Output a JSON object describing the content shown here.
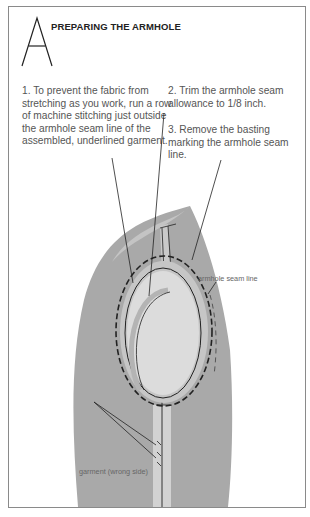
{
  "header": {
    "initial_letter": "A",
    "title": "PREPARING THE ARMHOLE"
  },
  "steps": [
    {
      "text": "1. To prevent the fabric from stretching as you work, run a row of machine stitching just outside the armhole seam line of the assembled, underlined garment."
    },
    {
      "text": "2. Trim the armhole seam allowance to 1/8 inch."
    },
    {
      "text": "3. Remove the basting marking the armhole seam line."
    }
  ],
  "labels": {
    "armhole_seam_line": "armhole seam line",
    "garment_wrong_side": "garment (wrong side)"
  },
  "colors": {
    "garment_fill": "#a9a9a9",
    "garment_top_highlight": "#c4c4c4",
    "armhole_inner": "#dcdcdc",
    "seam_allowance": "#c6c6c6",
    "line": "#222222",
    "frame_border": "#8a8a8a"
  }
}
